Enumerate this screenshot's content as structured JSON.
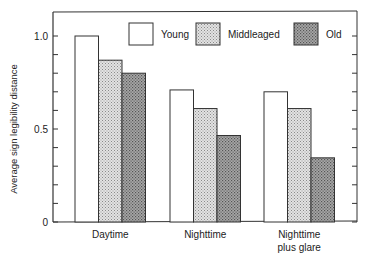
{
  "chart_data": {
    "type": "bar",
    "title": "",
    "xlabel": "",
    "ylabel": "Average sign legibility distance",
    "ylim": [
      0,
      1.1
    ],
    "yticks": [
      0,
      0.5,
      1.0
    ],
    "ytick_labels": [
      "0",
      "0.5",
      "1.0"
    ],
    "minor_tick_step": 0.1,
    "grid": false,
    "legend_position": "top-right inside",
    "categories": [
      "Daytime",
      "Nighttime",
      "Nighttime plus glare"
    ],
    "category_labels": [
      [
        "Daytime"
      ],
      [
        "Nighttime"
      ],
      [
        "Nighttime",
        "plus glare"
      ]
    ],
    "series": [
      {
        "name": "Young",
        "values": [
          1.0,
          0.71,
          0.7
        ],
        "fill": "#ffffff"
      },
      {
        "name": "Middleaged",
        "values": [
          0.87,
          0.61,
          0.61
        ],
        "fill": "#d4d4d4"
      },
      {
        "name": "Old",
        "values": [
          0.8,
          0.465,
          0.345
        ],
        "fill": "#9a9a9a"
      }
    ]
  }
}
